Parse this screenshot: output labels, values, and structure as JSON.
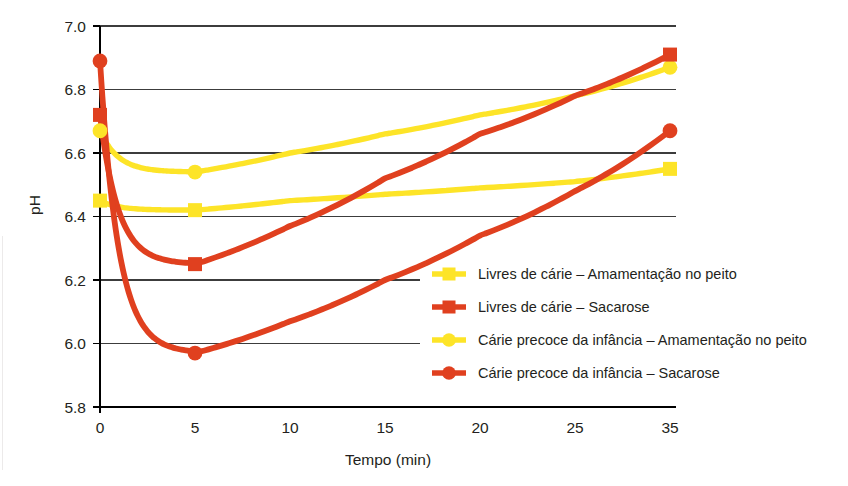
{
  "chart_data": {
    "type": "line",
    "title": "",
    "xlabel": "Tempo (min)",
    "ylabel": "pH",
    "x": [
      0,
      5,
      10,
      15,
      20,
      25,
      35
    ],
    "xtick_labels": [
      "0",
      "5",
      "10",
      "15",
      "20",
      "25",
      "35"
    ],
    "ytick_labels": [
      "5.8",
      "6.0",
      "6.2",
      "6.4",
      "6.6",
      "6.8",
      "7.0"
    ],
    "ylim": [
      5.8,
      7.0
    ],
    "ytick_values": [
      5.8,
      6.0,
      6.2,
      6.4,
      6.6,
      6.8,
      7.0
    ],
    "grid": true,
    "legend_position": "inside-right-lower",
    "series": [
      {
        "name": "Livres de cárie – Amamentação no peito",
        "color": "#fde428",
        "marker": "square",
        "marked_points": [
          {
            "x": 0,
            "y": 6.45
          },
          {
            "x": 5,
            "y": 6.42
          },
          {
            "x": 35,
            "y": 6.55
          }
        ],
        "values": [
          6.45,
          6.42,
          6.45,
          6.47,
          6.49,
          6.51,
          6.55
        ]
      },
      {
        "name": "Livres de cárie – Sacarose",
        "color": "#e0401f",
        "marker": "square",
        "marked_points": [
          {
            "x": 0,
            "y": 6.72
          },
          {
            "x": 5,
            "y": 6.25
          },
          {
            "x": 35,
            "y": 6.91
          }
        ],
        "values": [
          6.72,
          6.25,
          6.37,
          6.52,
          6.66,
          6.78,
          6.91
        ]
      },
      {
        "name": "Cárie precoce da infância – Amamentação no peito",
        "color": "#fde428",
        "marker": "circle",
        "marked_points": [
          {
            "x": 0,
            "y": 6.67
          },
          {
            "x": 5,
            "y": 6.54
          },
          {
            "x": 35,
            "y": 6.87
          }
        ],
        "values": [
          6.67,
          6.54,
          6.6,
          6.66,
          6.72,
          6.78,
          6.87
        ]
      },
      {
        "name": "Cárie precoce da infância – Sacarose",
        "color": "#e0401f",
        "marker": "circle",
        "marked_points": [
          {
            "x": 0,
            "y": 6.89
          },
          {
            "x": 5,
            "y": 5.97
          },
          {
            "x": 35,
            "y": 6.67
          }
        ],
        "values": [
          6.89,
          5.97,
          6.07,
          6.2,
          6.34,
          6.48,
          6.67
        ]
      }
    ],
    "legend": [
      {
        "label": "Livres de cárie – Amamentação no peito",
        "color": "#fde428",
        "marker": "square"
      },
      {
        "label": "Livres de cárie – Sacarose",
        "color": "#e0401f",
        "marker": "square"
      },
      {
        "label": "Cárie precoce da infância – Amamentação no peito",
        "color": "#fde428",
        "marker": "circle"
      },
      {
        "label": "Cárie precoce da infância – Sacarose",
        "color": "#e0401f",
        "marker": "circle"
      }
    ]
  }
}
